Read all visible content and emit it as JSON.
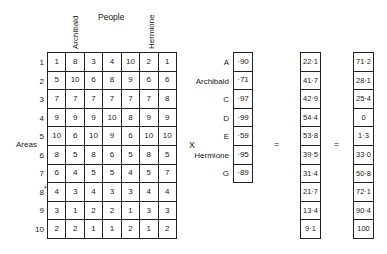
{
  "header": {
    "people_label": "People",
    "column_headers": [
      "Archibald",
      "Hermione"
    ]
  },
  "matrix": {
    "rows_label": "Areas",
    "row_labels": [
      "1",
      "2",
      "3",
      "4",
      "5",
      "6",
      "7",
      "8",
      "9",
      "10"
    ],
    "row_8_marker": "*",
    "values": [
      [
        "1",
        "8",
        "3",
        "4",
        "10",
        "2",
        "1"
      ],
      [
        "5",
        "10",
        "6",
        "8",
        "9",
        "6",
        "6"
      ],
      [
        "7",
        "7",
        "7",
        "7",
        "7",
        "7",
        "8"
      ],
      [
        "9",
        "9",
        "9",
        "10",
        "8",
        "9",
        "9"
      ],
      [
        "10",
        "6",
        "10",
        "9",
        "6",
        "10",
        "10"
      ],
      [
        "8",
        "5",
        "8",
        "6",
        "5",
        "8",
        "5"
      ],
      [
        "6",
        "4",
        "5",
        "5",
        "4",
        "5",
        "7"
      ],
      [
        "4",
        "3",
        "4",
        "3",
        "3",
        "4",
        "4"
      ],
      [
        "3",
        "1",
        "2",
        "2",
        "1",
        "3",
        "3"
      ],
      [
        "2",
        "2",
        "1",
        "1",
        "2",
        "1",
        "2"
      ]
    ]
  },
  "operator_multiply": "X",
  "weights": {
    "labels": [
      "A",
      "Archibald",
      "C",
      "D",
      "E",
      "Hermione",
      "G"
    ],
    "values": [
      "·90",
      "·71",
      "·97",
      "·99",
      "·59",
      "·95",
      "·89"
    ]
  },
  "operator_equals_1": "=",
  "result_1": [
    "22·1",
    "41·7",
    "42·9",
    "54·4",
    "53·8",
    "39·5",
    "31·4",
    "21·7",
    "13·4",
    "9·1"
  ],
  "operator_equals_2": "=",
  "result_2": [
    "71·2",
    "28·1",
    "25·4",
    "0",
    "1·3",
    "33·0",
    "50·8",
    "72·1",
    "90·4",
    "100"
  ]
}
